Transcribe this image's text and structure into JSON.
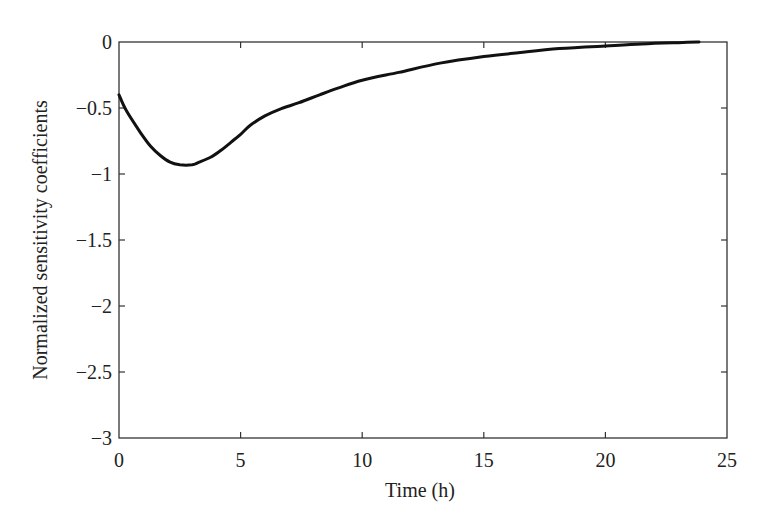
{
  "chart_data": {
    "type": "line",
    "title": "",
    "xlabel": "Time (h)",
    "ylabel": "Normalized sensitivity coefficients",
    "xlim": [
      0,
      25
    ],
    "ylim": [
      -3,
      0
    ],
    "xticks": [
      0,
      5,
      10,
      15,
      20,
      25
    ],
    "xtick_labels": [
      "0",
      "5",
      "10",
      "15",
      "20",
      "25"
    ],
    "yticks": [
      0,
      -0.5,
      -1,
      -1.5,
      -2,
      -2.5,
      -3
    ],
    "ytick_labels": [
      "0",
      "−0.5",
      "−1",
      "−1.5",
      "−2",
      "−2.5",
      "−3"
    ],
    "grid": false,
    "legend": null,
    "series": [
      {
        "name": "sensitivity",
        "color": "#111111",
        "x": [
          0,
          0.3,
          0.86,
          1.3,
          1.7,
          2.1,
          2.5,
          3.0,
          3.3,
          3.8,
          4.2,
          4.6,
          5.0,
          5.4,
          6.0,
          6.6,
          7.4,
          8.25,
          9.0,
          10.0,
          11.5,
          13.2,
          15.0,
          16.5,
          18.1,
          20.0,
          21.5,
          23.0,
          23.85
        ],
        "y": [
          -0.4,
          -0.52,
          -0.68,
          -0.79,
          -0.86,
          -0.91,
          -0.93,
          -0.93,
          -0.91,
          -0.87,
          -0.82,
          -0.76,
          -0.7,
          -0.63,
          -0.56,
          -0.51,
          -0.46,
          -0.4,
          -0.35,
          -0.29,
          -0.23,
          -0.16,
          -0.11,
          -0.08,
          -0.05,
          -0.03,
          -0.015,
          -0.005,
          0.0
        ]
      }
    ]
  }
}
